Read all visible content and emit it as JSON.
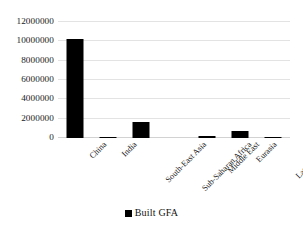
{
  "chart_data": {
    "type": "bar",
    "title": "",
    "xlabel": "",
    "ylabel": "",
    "categories": [
      "China",
      "India",
      "South-East Asia",
      "Sub-Saharan Africa",
      "Middle East",
      "Eurasia",
      "Latin America"
    ],
    "series": [
      {
        "name": "Built GFA",
        "color": "#000000",
        "values": [
          10250000,
          150000,
          1700000,
          0,
          250000,
          700000,
          60000
        ]
      }
    ],
    "values": [
      10250000,
      150000,
      1700000,
      0,
      250000,
      700000,
      60000
    ],
    "ylim": [
      0,
      12000000
    ],
    "ytick_values": [
      0,
      2000000,
      4000000,
      6000000,
      8000000,
      10000000,
      12000000
    ],
    "ytick_labels": [
      "0",
      "2000000",
      "4000000",
      "6000000",
      "8000000",
      "10000000",
      "12000000"
    ],
    "grid": true,
    "grid_color": "#e3e3e3",
    "legend_position": "bottom",
    "legend": [
      {
        "label": "Built GFA",
        "color": "#000000"
      }
    ],
    "background": "#ffffff"
  }
}
